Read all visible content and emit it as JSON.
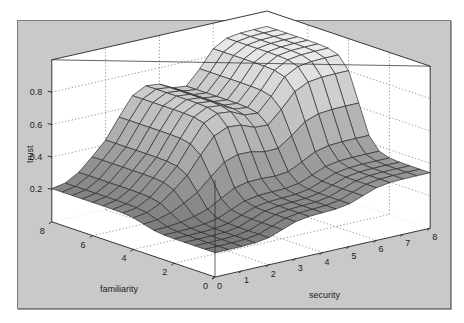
{
  "chart_data": {
    "type": "surface3d",
    "title": "",
    "xlabel": "security",
    "ylabel": "familiarity",
    "zlabel": "trust",
    "xlim": [
      0,
      8
    ],
    "ylim": [
      0,
      8
    ],
    "zlim": [
      0,
      1
    ],
    "x_ticks": [
      "0",
      "1",
      "2",
      "3",
      "4",
      "5",
      "6",
      "7",
      "8"
    ],
    "y_ticks": [
      "0",
      "2",
      "4",
      "6",
      "8"
    ],
    "z_ticks": [
      "0.2",
      "0.4",
      "0.6",
      "0.8"
    ],
    "z_tick_values": [
      0.2,
      0.4,
      0.6,
      0.8
    ],
    "grid": true,
    "grid_n": 16,
    "plateaus": {
      "security_steps": [
        2.5,
        5.5
      ],
      "familiarity_steps": [
        3.5
      ],
      "low": 0.15,
      "mid": 0.5,
      "high": 0.9
    },
    "colors": {
      "frame_bg": "#c9c9c9",
      "box_bg": "#ffffff",
      "mesh_line": "#333333",
      "surface_low": "#707070",
      "surface_high": "#e8e8e8"
    }
  }
}
